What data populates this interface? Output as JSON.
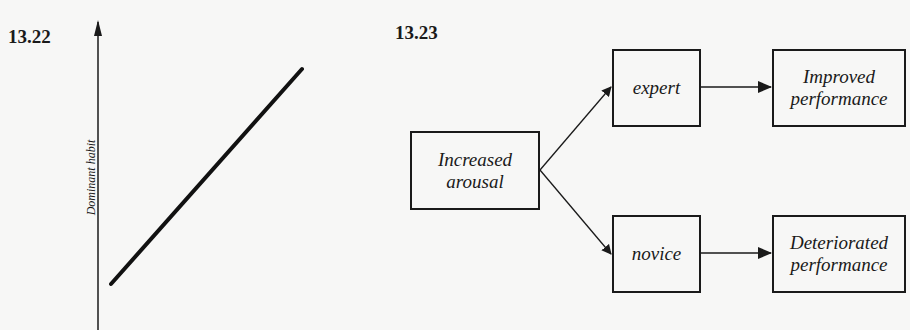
{
  "figures": [
    {
      "id": "13.22",
      "label": "13.22",
      "type": "line-graph",
      "y_axis_label": "Dominant habit",
      "x_axis_label": ""
    },
    {
      "id": "13.23",
      "label": "13.23",
      "type": "flow-diagram",
      "nodes": {
        "increased_arousal": "Increased arousal",
        "expert": "expert",
        "novice": "novice",
        "improved": "Improved performance",
        "deteriorated": "Deteriorated performance"
      },
      "edges": [
        [
          "increased_arousal",
          "expert"
        ],
        [
          "increased_arousal",
          "novice"
        ],
        [
          "expert",
          "improved"
        ],
        [
          "novice",
          "deteriorated"
        ]
      ]
    }
  ],
  "text": {
    "fig1_label": "13.22",
    "fig2_label": "13.23",
    "y_axis_label": "Dominant habit",
    "node_increased_l1": "Increased",
    "node_increased_l2": "arousal",
    "node_expert": "expert",
    "node_novice": "novice",
    "node_improved_l1": "Improved",
    "node_improved_l2": "performance",
    "node_deteriorated_l1": "Deteriorated",
    "node_deteriorated_l2": "performance"
  }
}
